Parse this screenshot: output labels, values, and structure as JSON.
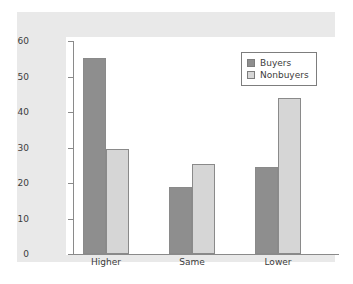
{
  "chart_data": {
    "type": "bar",
    "title": "",
    "xlabel": "",
    "ylabel": "",
    "categories": [
      "Higher",
      "Same",
      "Lower"
    ],
    "series": [
      {
        "name": "Buyers",
        "color": "#8e8e8e",
        "values": [
          55.3,
          19.0,
          24.6
        ]
      },
      {
        "name": "Nonbuyers",
        "color": "#d6d6d6",
        "values": [
          29.7,
          25.4,
          44.0
        ]
      }
    ],
    "ylim": [
      0,
      60
    ],
    "yticks": [
      0,
      10,
      20,
      30,
      40,
      50,
      60
    ],
    "ytick_labels": [
      "0",
      "10",
      "20",
      "30",
      "40",
      "50",
      "60"
    ],
    "grid": false,
    "legend_position": "top-right",
    "legend_entries": [
      "Buyers",
      "Nonbuyers"
    ]
  },
  "style": {
    "frame_color": "#e9e9e9",
    "plot_background": "#ffffff",
    "axis_color": "#8a8a8a",
    "text_color": "#3c3c3c"
  }
}
